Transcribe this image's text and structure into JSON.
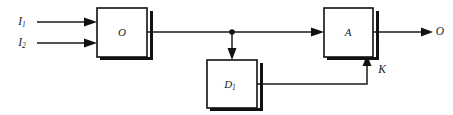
{
  "diagram": {
    "type": "block-diagram",
    "title": "",
    "background_color": "#ffffff",
    "line_color": "#1a1a1a",
    "blocks": [
      {
        "id": "block-o",
        "label": "O",
        "label_base": "O",
        "label_sub": "",
        "x": 97,
        "y": 8,
        "width": 50,
        "height": 49
      },
      {
        "id": "block-d1",
        "label": "D1",
        "label_base": "D",
        "label_sub": "1",
        "x": 207,
        "y": 60,
        "width": 50,
        "height": 48
      },
      {
        "id": "block-a",
        "label": "A",
        "label_base": "A",
        "label_sub": "",
        "x": 324,
        "y": 8,
        "width": 49,
        "height": 49
      }
    ],
    "signals": [
      {
        "id": "input-i1",
        "label_base": "I",
        "label_sub": "1",
        "label": "I1",
        "role": "input",
        "x": 22,
        "y": 22
      },
      {
        "id": "input-i2",
        "label_base": "I",
        "label_sub": "2",
        "label": "I2",
        "role": "input",
        "x": 22,
        "y": 43
      },
      {
        "id": "feedback-k",
        "label_base": "K",
        "label_sub": "",
        "label": "K",
        "role": "feedback",
        "x": 382,
        "y": 70
      },
      {
        "id": "output-o",
        "label_base": "O",
        "label_sub": "",
        "label": "O",
        "role": "output",
        "x": 440,
        "y": 32
      }
    ],
    "junctions": [
      {
        "id": "tap-point",
        "x": 232,
        "y": 32
      }
    ],
    "connections": [
      {
        "id": "wire-i1-to-o",
        "from": "input-i1",
        "to": "block-o",
        "arrow": true
      },
      {
        "id": "wire-i2-to-o",
        "from": "input-i2",
        "to": "block-o",
        "arrow": true
      },
      {
        "id": "wire-o-to-a",
        "from": "block-o",
        "to": "block-a",
        "arrow": true
      },
      {
        "id": "wire-tap-to-d1",
        "from": "tap-point",
        "to": "block-d1",
        "arrow": true
      },
      {
        "id": "wire-d1-to-a",
        "from": "block-d1",
        "to": "block-a",
        "arrow": true
      },
      {
        "id": "wire-a-to-output",
        "from": "block-a",
        "to": "output-o",
        "arrow": true
      }
    ]
  }
}
